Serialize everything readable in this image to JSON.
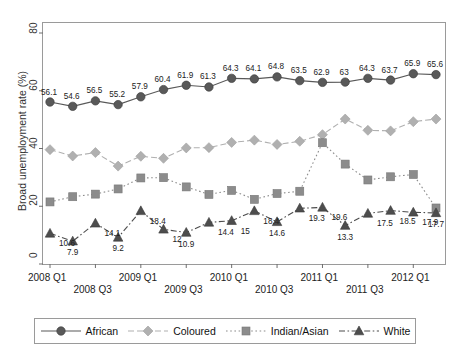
{
  "chart_data": {
    "type": "line",
    "title": "",
    "xlabel": "",
    "ylabel": "Broad unemployment rate (%)",
    "ylim": [
      0,
      80
    ],
    "yticks": [
      0,
      20,
      40,
      60,
      80
    ],
    "grid": false,
    "legend_position": "bottom",
    "x": [
      "2008 Q1",
      "2008 Q2",
      "2008 Q3",
      "2008 Q4",
      "2009 Q1",
      "2009 Q2",
      "2009 Q3",
      "2009 Q4",
      "2010 Q1",
      "2010 Q2",
      "2010 Q3",
      "2010 Q4",
      "2011 Q1",
      "2011 Q2",
      "2011 Q3",
      "2011 Q4",
      "2012 Q1",
      "2012 Q2"
    ],
    "xtick_labels_top": [
      "2008 Q1",
      "2009 Q1",
      "2010 Q1",
      "2011 Q1",
      "2012 Q1"
    ],
    "xtick_labels_bottom": [
      "2008 Q3",
      "2009 Q3",
      "2010 Q3",
      "2011 Q3"
    ],
    "series": [
      {
        "name": "African",
        "color": "#595959",
        "marker": "circle",
        "linestyle": "solid",
        "labelled": true,
        "values": [
          56.1,
          54.6,
          56.5,
          55.2,
          57.9,
          60.4,
          61.9,
          61.3,
          64.3,
          64.1,
          64.8,
          63.5,
          62.9,
          63.0,
          64.3,
          63.7,
          65.9,
          65.6
        ],
        "labels": [
          "56.1",
          "54.6",
          "56.5",
          "55.2",
          "57.9",
          "60.4",
          "61.9",
          "61.3",
          "64.3",
          "64.1",
          "64.8",
          "63.5",
          "62.9",
          "63",
          "64.3",
          "63.7",
          "65.9",
          "65.6"
        ]
      },
      {
        "name": "Coloured",
        "color": "#b0b0b0",
        "marker": "diamond",
        "linestyle": "dashed",
        "labelled": false,
        "values": [
          39.6,
          37.4,
          38.6,
          33.9,
          37.3,
          36.6,
          40.2,
          40.3,
          42.1,
          42.9,
          41.4,
          42.5,
          44.8,
          50.2,
          46.3,
          46.1,
          49.3,
          50.2
        ],
        "labels": []
      },
      {
        "name": "Indian/Asian",
        "color": "#8c8c8c",
        "marker": "square",
        "linestyle": "dotted",
        "labelled": false,
        "values": [
          21.5,
          23.3,
          24.2,
          26.0,
          29.8,
          29.9,
          26.7,
          24.1,
          25.5,
          22.4,
          24.4,
          25.2,
          42.0,
          34.6,
          29.1,
          30.2,
          31.0,
          19.4
        ],
        "labels": []
      },
      {
        "name": "White",
        "color": "#4d4d4d",
        "marker": "triangle",
        "linestyle": "dashdot",
        "labelled": true,
        "values": [
          10.6,
          7.9,
          14.1,
          9.2,
          18.4,
          12.0,
          10.9,
          14.4,
          15.0,
          18.4,
          14.6,
          19.3,
          19.6,
          13.3,
          17.5,
          18.5,
          17.9,
          17.7
        ],
        "labels": [
          "10.6",
          "7.9",
          "14.1",
          "9.2",
          "18.4",
          "12",
          "10.9",
          "14.4",
          "15",
          "18.4",
          "14.6",
          "19.3",
          "19.6",
          "13.3",
          "17.5",
          "18.5",
          "17.9",
          "17.7"
        ]
      }
    ]
  },
  "axis": {
    "y_title": "Broad unemployment rate (%)",
    "y_tick_0": "0",
    "y_tick_20": "20",
    "y_tick_40": "40",
    "y_tick_60": "60",
    "y_tick_80": "80"
  },
  "legend": {
    "items": [
      {
        "label": "African"
      },
      {
        "label": "Coloured"
      },
      {
        "label": "Indian/Asian"
      },
      {
        "label": "White"
      }
    ]
  }
}
